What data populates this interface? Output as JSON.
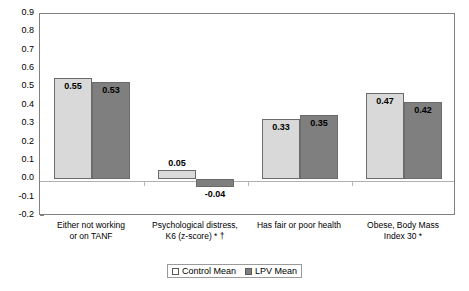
{
  "chart_data": {
    "type": "bar",
    "title": "",
    "xlabel": "",
    "ylabel": "",
    "ylim": [
      -0.2,
      0.9
    ],
    "ytick_labels": [
      "0.9",
      "0.8",
      "0.7",
      "0.6",
      "0.5",
      "0.4",
      "0.3",
      "0.2",
      "0.1",
      "0.0",
      "-0.1",
      "-0.2"
    ],
    "ytick_values": [
      0.9,
      0.8,
      0.7,
      0.6,
      0.5,
      0.4,
      0.3,
      0.2,
      0.1,
      0.0,
      -0.1,
      -0.2
    ],
    "grid": false,
    "legend_position": "bottom-center",
    "categories": [
      "Either not working or on TANF",
      "Psychological distress, K6 (z-score) * †",
      "Has fair or poor health",
      "Obese, Body Mass Index  30 *"
    ],
    "category_lines": [
      [
        "Either not working",
        "or on TANF"
      ],
      [
        "Psychological distress,",
        "K6 (z-score) * †"
      ],
      [
        "Has fair or poor health"
      ],
      [
        "Obese, Body Mass",
        "Index  30 *"
      ]
    ],
    "series": [
      {
        "name": "Control Mean",
        "color": "#d9d9d9",
        "values": [
          0.55,
          0.05,
          0.33,
          0.47
        ],
        "value_labels": [
          "0.55",
          "0.05",
          "0.33",
          "0.47"
        ]
      },
      {
        "name": "LPV Mean",
        "color": "#7f7f7f",
        "values": [
          0.53,
          -0.04,
          0.35,
          0.42
        ],
        "value_labels": [
          "0.53",
          "-0.04",
          "0.35",
          "0.42"
        ]
      }
    ]
  },
  "legend": {
    "entries": [
      {
        "label": "Control Mean"
      },
      {
        "label": "LPV Mean"
      }
    ]
  },
  "colors": {
    "control_bar": "#d9d9d9",
    "lpv_bar": "#7f7f7f",
    "axis": "#808080",
    "zero_line": "#b0b0b0"
  }
}
